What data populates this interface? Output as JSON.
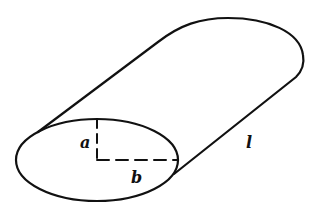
{
  "figure": {
    "labels": {
      "semi_axis_vertical": "a",
      "semi_axis_horizontal": "b",
      "length": "l"
    },
    "stroke_color": "#111111",
    "background": "#ffffff"
  }
}
